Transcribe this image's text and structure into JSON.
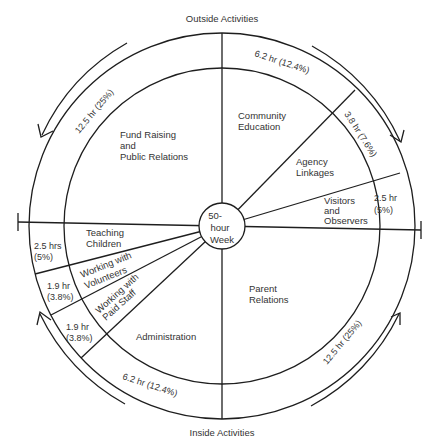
{
  "diagram": {
    "title_top": "Outside Activities",
    "title_bottom": "Inside Activities",
    "center": {
      "line1": "50-",
      "line2": "hour",
      "line3": "Week"
    },
    "segments": [
      {
        "id": "fund-raising",
        "group": "outside",
        "label_lines": [
          "Fund Raising",
          "and",
          "Public Relations"
        ],
        "hours_label": "12.5 hr (25%)",
        "hours": 12.5,
        "percent": 25
      },
      {
        "id": "community-education",
        "group": "outside",
        "label_lines": [
          "Community",
          "Education"
        ],
        "hours_label": "6.2 hr (12.4%)",
        "hours": 6.2,
        "percent": 12.4
      },
      {
        "id": "agency-linkages",
        "group": "outside",
        "label_lines": [
          "Agency",
          "Linkages"
        ],
        "hours_label": "3.8 hr (7.6%)",
        "hours": 3.8,
        "percent": 7.6
      },
      {
        "id": "visitors-observers",
        "group": "outside",
        "label_lines": [
          "Visitors",
          "and",
          "Observers"
        ],
        "hours_label_lines": [
          "2.5 hr",
          "(5%)"
        ],
        "hours": 2.5,
        "percent": 5
      },
      {
        "id": "parent-relations",
        "group": "inside",
        "label_lines": [
          "Parent",
          "Relations"
        ],
        "hours_label": "12.5 hr (25%)",
        "hours": 12.5,
        "percent": 25
      },
      {
        "id": "administration",
        "group": "inside",
        "label_lines": [
          "Administration"
        ],
        "hours_label": "6.2 hr (12.4%)",
        "hours": 6.2,
        "percent": 12.4
      },
      {
        "id": "working-paid-staff",
        "group": "inside",
        "label_lines": [
          "Working with",
          "Paid Staff"
        ],
        "hours_label_lines": [
          "1.9 hr",
          "(3.8%)"
        ],
        "hours": 1.9,
        "percent": 3.8
      },
      {
        "id": "working-volunteers",
        "group": "inside",
        "label_lines": [
          "Working with",
          "Volunteers"
        ],
        "hours_label_lines": [
          "1.9 hr",
          "(3.8%)"
        ],
        "hours": 1.9,
        "percent": 3.8
      },
      {
        "id": "teaching-children",
        "group": "inside",
        "label_lines": [
          "Teaching",
          "Children"
        ],
        "hours_label_lines": [
          "2.5 hrs",
          "(5%)"
        ],
        "hours": 2.5,
        "percent": 5
      }
    ],
    "colors": {
      "line": "#1e1e1e",
      "text": "#333333",
      "background": "#ffffff"
    }
  }
}
